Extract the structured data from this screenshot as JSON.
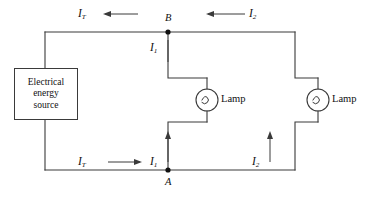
{
  "figure": {
    "type": "circuit-diagram",
    "background_color": "#ffffff",
    "wire_color": "#3a3a3a"
  },
  "source": {
    "name": "electrical-energy-source",
    "line1": "Electrical",
    "line2": "energy",
    "line3": "source"
  },
  "nodes": [
    {
      "id": "B",
      "label": "B",
      "x": 168,
      "y": 32,
      "label_position": "above"
    },
    {
      "id": "A",
      "label": "A",
      "x": 168,
      "y": 170,
      "label_position": "below"
    }
  ],
  "lamps": [
    {
      "id": "lamp-1",
      "label": "Lamp",
      "cx": 207,
      "cy": 100
    },
    {
      "id": "lamp-2",
      "label": "Lamp",
      "cx": 318,
      "cy": 100
    }
  ],
  "currents": [
    {
      "id": "I_T-top",
      "symbol": "I",
      "subscript": "T",
      "direction": "left",
      "x": 84,
      "y": 14
    },
    {
      "id": "I_2-top",
      "symbol": "I",
      "subscript": "2",
      "direction": "left",
      "x": 252,
      "y": 14
    },
    {
      "id": "I_1-top",
      "symbol": "I",
      "subscript": "1",
      "direction": "down",
      "x": 148,
      "y": 48
    },
    {
      "id": "I_T-bottom",
      "symbol": "I",
      "subscript": "T",
      "direction": "right",
      "x": 84,
      "y": 162
    },
    {
      "id": "I_1-bottom",
      "symbol": "I",
      "subscript": "1",
      "direction": "up",
      "x": 148,
      "y": 162
    },
    {
      "id": "I_2-bottom",
      "symbol": "I",
      "subscript": "2",
      "direction": "up",
      "x": 252,
      "y": 162
    }
  ],
  "labels": {
    "I": "I",
    "sub_T": "T",
    "sub_1": "1",
    "sub_2": "2",
    "node_B": "B",
    "node_A": "A",
    "lamp": "Lamp"
  }
}
